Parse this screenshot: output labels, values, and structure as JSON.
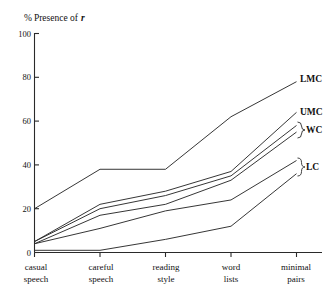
{
  "figure": {
    "axis_title_pct": "%",
    "axis_title_rest": "Presence of",
    "axis_title_var": "r"
  },
  "chart_data": {
    "type": "line",
    "xlabel": "",
    "ylabel": "% Presence of r",
    "ylim": [
      0,
      100
    ],
    "yticks": [
      0,
      20,
      40,
      60,
      80,
      100
    ],
    "ytick_labels": [
      "0",
      "20",
      "40",
      "60",
      "80",
      "100"
    ],
    "grid": false,
    "legend_position": "right-inline",
    "categories": [
      "casual speech",
      "careful speech",
      "reading style",
      "word lists",
      "minimal pairs"
    ],
    "category_lines": [
      [
        "casual",
        "speech"
      ],
      [
        "careful",
        "speech"
      ],
      [
        "reading",
        "style"
      ],
      [
        "word",
        "lists"
      ],
      [
        "minimal",
        "pairs"
      ]
    ],
    "series": [
      {
        "name": "LMC",
        "label": "LMC",
        "braced": false,
        "values": [
          20,
          38,
          38,
          62,
          78
        ]
      },
      {
        "name": "UMC",
        "label": "UMC",
        "braced": false,
        "values": [
          5,
          22,
          28,
          37,
          64
        ]
      },
      {
        "name": "WC-upper",
        "label": "WC",
        "braced": true,
        "values": [
          5,
          20,
          26,
          35,
          58
        ]
      },
      {
        "name": "WC-lower",
        "label": "",
        "braced": true,
        "values": [
          4,
          17,
          22,
          33,
          55
        ]
      },
      {
        "name": "LC-upper",
        "label": "LC",
        "braced": true,
        "values": [
          4,
          11,
          19,
          24,
          42
        ]
      },
      {
        "name": "LC-lower",
        "label": "",
        "braced": true,
        "values": [
          1,
          1,
          6,
          12,
          36
        ]
      }
    ],
    "series_labels": [
      "LMC",
      "UMC",
      "WC",
      "LC"
    ],
    "annotations": [
      {
        "text": "LMC",
        "at_series": "LMC",
        "y": 78
      },
      {
        "text": "UMC",
        "at_series": "UMC",
        "y": 64
      },
      {
        "text": "WC",
        "at_series": "WC-upper",
        "y": 56,
        "brace": true
      },
      {
        "text": "LC",
        "at_series": "LC-upper",
        "y": 39,
        "brace": true
      }
    ]
  }
}
